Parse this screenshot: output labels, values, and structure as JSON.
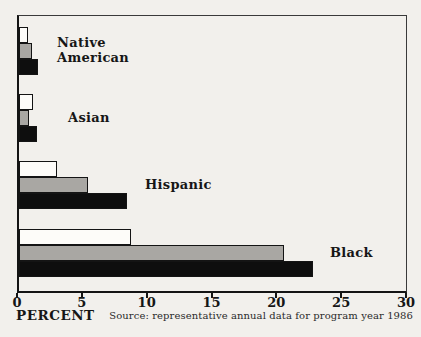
{
  "chart_data": {
    "type": "bar",
    "orientation": "horizontal",
    "title": "",
    "categories": [
      "Native American",
      "Asian",
      "Hispanic",
      "Black"
    ],
    "category_label_lines": [
      [
        "Native",
        "American"
      ],
      [
        "Asian"
      ],
      [
        "Hispanic"
      ],
      [
        "Black"
      ]
    ],
    "series": [
      {
        "name": "white",
        "color": "#fdfcf9",
        "values": [
          0.7,
          1.1,
          2.9,
          8.6
        ]
      },
      {
        "name": "gray",
        "color": "#a9a7a3",
        "values": [
          1.0,
          0.8,
          5.3,
          20.4
        ]
      },
      {
        "name": "black",
        "color": "#0e0e0e",
        "values": [
          1.5,
          1.4,
          8.3,
          22.7
        ]
      }
    ],
    "xlabel": "PERCENT",
    "x_ticks": [
      0,
      5,
      10,
      15,
      20,
      25,
      30
    ],
    "xlim": [
      0,
      30
    ],
    "grid": false,
    "legend": "none",
    "source_note": "Source: representative annual data for program year 1986",
    "label_x_px": [
      57,
      68,
      145,
      330
    ],
    "colors": {
      "background": "#f2f0ec",
      "frame": "#141414",
      "text": "#161616"
    }
  }
}
